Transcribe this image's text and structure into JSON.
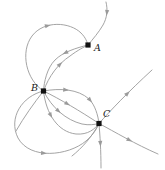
{
  "figure": {
    "width": 165,
    "height": 170,
    "background_color": "#ffffff",
    "curve_color": "#9a9a9a",
    "node_color": "#111111",
    "label_color": "#1a1a1a"
  },
  "nodes": [
    {
      "id": "A",
      "label": "A",
      "x": 88,
      "y": 45,
      "label_x": 94,
      "label_y": 51,
      "marker": "square-dot"
    },
    {
      "id": "B",
      "label": "B",
      "x": 43.5,
      "y": 91,
      "label_x": 31,
      "label_y": 91,
      "marker": "square-dot"
    },
    {
      "id": "C",
      "label": "C",
      "x": 99,
      "y": 123.5,
      "label_x": 103,
      "label_y": 117,
      "marker": "square-dot"
    }
  ],
  "chart_data": {
    "type": "diagram",
    "subtype": "phase-portrait",
    "node_labels": [
      "A",
      "B",
      "C"
    ],
    "node_positions": [
      [
        88,
        45
      ],
      [
        43.5,
        91
      ],
      [
        99,
        123.5
      ]
    ],
    "curve_count": 14,
    "arrow_count": 18
  },
  "curves": [
    {
      "name": "inflow-from-top-right",
      "d": "M 106 2 C 108 10, 107 18, 103 25 C 99 32, 93 39, 88 45",
      "arrows": [
        {
          "t": 0.22,
          "dir": "down"
        }
      ]
    },
    {
      "name": "outer-upper-loop-B-to-A",
      "d": "M 43.5 91 C 26 80, 20 52, 32 36 C 44 20, 70 22, 81 33 C 86 38, 87 42, 88 45",
      "arrows": [
        {
          "t": 0.62,
          "dir": "right-down"
        }
      ]
    },
    {
      "name": "upper-lens-A-to-B-inner",
      "d": "M 88 45 C 76 48, 63 52, 55 60 C 47 68, 44 82, 43.5 91",
      "arrows": [
        {
          "t": 0.34,
          "dir": "left-down"
        }
      ]
    },
    {
      "name": "upper-lens-B-to-A-outer",
      "d": "M 43.5 91 C 49 76, 58 64, 70 56 C 78 50, 84 47, 88 45",
      "arrows": [
        {
          "t": 0.48,
          "dir": "right-up"
        }
      ]
    },
    {
      "name": "B-to-C-upper-arc",
      "d": "M 43.5 91 C 60 88, 78 89, 89 99 C 95 105, 98 115, 99 123.5",
      "arrows": [
        {
          "t": 0.3,
          "dir": "right"
        },
        {
          "t": 0.66,
          "dir": "down-right"
        }
      ]
    },
    {
      "name": "B-to-C-straight-chord",
      "d": "M 43.5 91 C 60 99, 80 111, 99 123.5",
      "arrows": [
        {
          "t": 0.42,
          "dir": "down-right"
        }
      ]
    },
    {
      "name": "B-to-C-lower-arc",
      "d": "M 43.5 91 C 52 108, 66 120, 82 124 C 89 125.5, 95 124.5, 99 123.5",
      "arrows": [
        {
          "t": 0.36,
          "dir": "down-right"
        }
      ]
    },
    {
      "name": "B-to-C-deep-arc",
      "d": "M 43.5 91 C 46 114, 58 132, 76 134 C 88 135, 95 129, 99 123.5",
      "arrows": [
        {
          "t": 0.3,
          "dir": "down"
        }
      ]
    },
    {
      "name": "big-bottom-left-loop-B-to-C",
      "d": "M 43.5 91 C 22 96, 8 118, 18 138 C 30 160, 68 156, 86 141 C 94 134, 97 128, 99 123.5",
      "arrows": [
        {
          "t": 0.58,
          "dir": "right"
        }
      ]
    },
    {
      "name": "C-outgoing-up-right",
      "d": "M 99 123.5 C 110 111, 128 92, 152 70",
      "arrows": [
        {
          "t": 0.55,
          "dir": "up-right"
        }
      ]
    },
    {
      "name": "C-outgoing-down-right",
      "d": "M 99 123.5 C 115 132, 135 144, 158 154",
      "arrows": [
        {
          "t": 0.52,
          "dir": "down-right"
        }
      ]
    },
    {
      "name": "C-outgoing-down",
      "d": "M 99 123.5 C 100 136, 101 150, 101 168",
      "arrows": [
        {
          "t": 0.45,
          "dir": "up"
        }
      ]
    },
    {
      "name": "C-lower-left-tail",
      "d": "M 99 123.5 C 92 137, 82 148, 72 156",
      "arrows": []
    },
    {
      "name": "B-lower-left-tail",
      "d": "M 43.5 91 C 34 103, 24 117, 16 131",
      "arrows": []
    }
  ]
}
